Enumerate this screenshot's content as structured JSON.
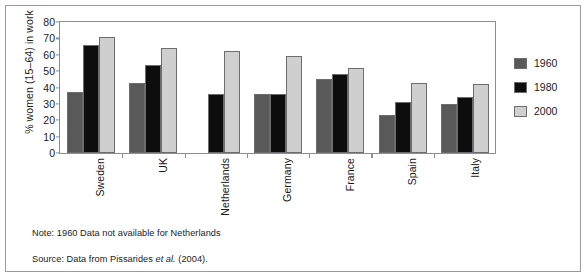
{
  "chart_data": {
    "type": "bar",
    "title": "",
    "xlabel": "",
    "ylabel": "% women (15–64) in work",
    "ylim": [
      0,
      80
    ],
    "yticks": [
      0,
      10,
      20,
      30,
      40,
      50,
      60,
      70,
      80
    ],
    "ytick_labels": [
      "0",
      "10",
      "20",
      "30",
      "40",
      "50",
      "60",
      "70",
      "80"
    ],
    "grid": false,
    "legend_position": "right",
    "categories": [
      "Sweden",
      "UK",
      "Netherlands",
      "Germany",
      "France",
      "Spain",
      "Italy"
    ],
    "series": [
      {
        "name": "1960",
        "color": "#595959",
        "values": [
          37,
          43,
          null,
          36,
          45,
          23,
          30
        ]
      },
      {
        "name": "1980",
        "color": "#0d0d0d",
        "values": [
          66,
          54,
          36,
          36,
          48,
          31,
          34
        ]
      },
      {
        "name": "2000",
        "color": "#cfcfcf",
        "values": [
          71,
          64,
          62,
          59,
          52,
          43,
          42
        ]
      }
    ],
    "annotations": [
      "Note: 1960 Data not available for Netherlands",
      "Source: Data from Pissarides et al. (2004)."
    ]
  },
  "axis": {
    "y_title": "% women (15–64) in work",
    "ticks": [
      "80",
      "70",
      "60",
      "50",
      "40",
      "30",
      "20",
      "10",
      "0"
    ]
  },
  "legend": {
    "items": [
      {
        "label": "1960",
        "color": "#595959"
      },
      {
        "label": "1980",
        "color": "#0d0d0d"
      },
      {
        "label": "2000",
        "color": "#cfcfcf"
      }
    ]
  },
  "footnotes": {
    "note_prefix": "Note: 1960 Data not available for Netherlands",
    "source_lead": "Source:  Data from Pissarides ",
    "source_italic": "et al.",
    "source_tail": " (2004)."
  },
  "colors": {
    "frame": "#9a9a9a",
    "axis": "#8d8d8d",
    "bar_1960": "#595959",
    "bar_1980": "#0d0d0d",
    "bar_2000": "#cfcfcf",
    "bar_edge": "#6d6d6d",
    "text": "#1a1a1a",
    "background": "#ffffff"
  }
}
